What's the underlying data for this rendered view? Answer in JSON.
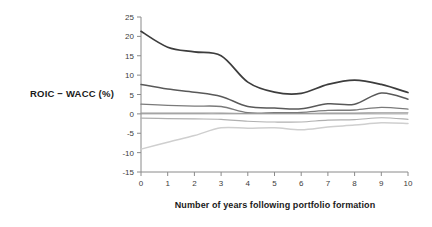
{
  "chart_data": {
    "type": "line",
    "title": "",
    "subtitle": "",
    "xlabel": "Number of years following portfolio formation",
    "ylabel": "ROIC − WACC (%)",
    "xlim": [
      0,
      10
    ],
    "ylim": [
      -15,
      25
    ],
    "ytick_step": 5,
    "xtick_step": 1,
    "grid": false,
    "legend_position": "none",
    "zero_reference_line": true,
    "x": [
      0,
      1,
      2,
      3,
      4,
      5,
      6,
      7,
      8,
      9,
      10
    ],
    "xticklabels": [
      "0",
      "1",
      "2",
      "3",
      "4",
      "5",
      "6",
      "7",
      "8",
      "9",
      "10"
    ],
    "yticklabels": [
      "-15",
      "-10",
      "-5",
      "0",
      "5",
      "10",
      "15",
      "20",
      "25"
    ],
    "ytickvalues": [
      -15,
      -10,
      -5,
      0,
      5,
      10,
      15,
      20,
      25
    ],
    "series": [
      {
        "name": "Top quintile",
        "color": "#3d3d3d",
        "width": 1.7,
        "values": [
          21.3,
          17.2,
          16.0,
          15.0,
          8.2,
          5.6,
          5.3,
          7.6,
          8.7,
          7.6,
          5.5
        ]
      },
      {
        "name": "Second quintile",
        "color": "#595959",
        "width": 1.5,
        "values": [
          7.6,
          6.4,
          5.6,
          4.5,
          1.9,
          1.5,
          1.3,
          2.6,
          2.5,
          5.4,
          3.8
        ]
      },
      {
        "name": "Third quintile",
        "color": "#7a7a7a",
        "width": 1.3,
        "values": [
          2.5,
          2.2,
          2.0,
          1.9,
          0.3,
          0.3,
          0.4,
          0.9,
          1.0,
          1.7,
          1.2
        ]
      },
      {
        "name": "Median reference",
        "color": "#9a9a9a",
        "width": 1.1,
        "values": [
          0.2,
          0.2,
          0.2,
          0.2,
          0.1,
          0.1,
          0.1,
          0.2,
          0.2,
          0.3,
          0.3
        ]
      },
      {
        "name": "Fourth quintile",
        "color": "#b0b0b0",
        "width": 1.2,
        "values": [
          -1.1,
          -1.2,
          -1.3,
          -1.4,
          -1.9,
          -2.1,
          -2.1,
          -1.6,
          -1.5,
          -1.0,
          -1.4
        ]
      },
      {
        "name": "Bottom quintile",
        "color": "#cfcfcf",
        "width": 1.5,
        "values": [
          -9.1,
          -7.3,
          -5.6,
          -3.6,
          -3.7,
          -3.6,
          -4.1,
          -3.4,
          -2.9,
          -2.3,
          -2.5
        ]
      }
    ]
  },
  "axes": {
    "y_axis_title": "ROIC − WACC (%)",
    "x_axis_title": "Number of years following portfolio formation"
  }
}
